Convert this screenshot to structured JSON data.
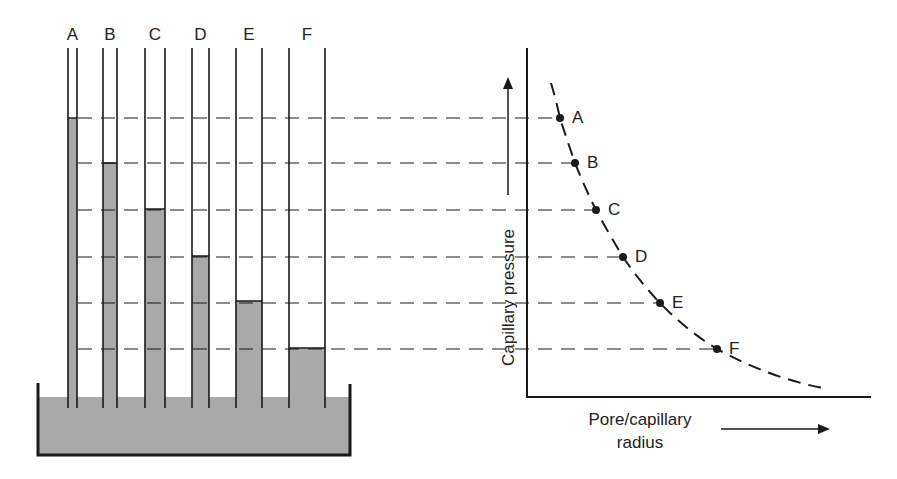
{
  "diagram": {
    "colors": {
      "liquid": "#a9a9a9",
      "line": "#1a1a1a",
      "background": "#ffffff"
    },
    "tubes": [
      {
        "label": "A",
        "left": 68,
        "right": 77,
        "level_y": 118
      },
      {
        "label": "B",
        "left": 103,
        "right": 117,
        "level_y": 163
      },
      {
        "label": "C",
        "left": 145,
        "right": 165,
        "level_y": 209
      },
      {
        "label": "D",
        "left": 192,
        "right": 209,
        "level_y": 256
      },
      {
        "label": "E",
        "left": 236,
        "right": 262,
        "level_y": 301
      },
      {
        "label": "F",
        "left": 289,
        "right": 325,
        "level_y": 348
      }
    ],
    "bath": {
      "left": 38,
      "right": 350,
      "liquid_top": 397,
      "bottom": 455
    },
    "chart": {
      "y_axis_label": "Capillary pressure",
      "x_axis_label_line1": "Pore/capillary",
      "x_axis_label_line2": "radius",
      "points": [
        {
          "label": "A",
          "x": 560,
          "y": 118
        },
        {
          "label": "B",
          "x": 575,
          "y": 163
        },
        {
          "label": "C",
          "x": 596,
          "y": 210
        },
        {
          "label": "D",
          "x": 623,
          "y": 257
        },
        {
          "label": "E",
          "x": 660,
          "y": 303
        },
        {
          "label": "F",
          "x": 717,
          "y": 349
        }
      ]
    }
  },
  "chart_data": {
    "type": "line",
    "title": "",
    "xlabel": "Pore/capillary radius",
    "ylabel": "Capillary pressure",
    "categories": [
      "A",
      "B",
      "C",
      "D",
      "E",
      "F"
    ],
    "series": [
      {
        "name": "Capillary pressure vs radius (relative, read from figure)",
        "x": [
          1,
          1.4,
          2.0,
          2.7,
          3.7,
          5.2
        ],
        "values": [
          6,
          5,
          4,
          3,
          2,
          1
        ]
      }
    ],
    "grid": false,
    "legend": "none"
  }
}
